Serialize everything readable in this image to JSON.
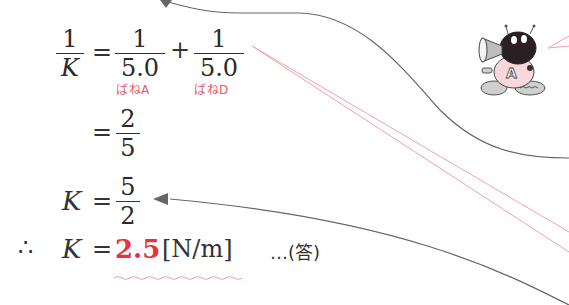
{
  "equation": {
    "line1": {
      "lhs": {
        "numerator": "1",
        "denominator": "K"
      },
      "equals": "=",
      "term1": {
        "numerator": "1",
        "denominator": "5.0",
        "label": "ばねA"
      },
      "plus": "+",
      "term2": {
        "numerator": "1",
        "denominator": "5.0",
        "label": "ばねD"
      }
    },
    "line2": {
      "equals": "=",
      "numerator": "2",
      "denominator": "5"
    },
    "line3": {
      "lhs": "K",
      "equals": "=",
      "numerator": "5",
      "denominator": "2"
    },
    "line4": {
      "therefore": "∴",
      "lhs": "K",
      "equals": "=",
      "value": "2.5",
      "unit": "[N/m]",
      "answer_marker": "…(答)"
    }
  },
  "colors": {
    "text": "#2a2a2a",
    "accent_red": "#e8323c",
    "label_pink": "#e85a6a",
    "arrow_gray": "#666666",
    "pointer_pink": "#f2a0aa"
  },
  "illustration": {
    "name": "robot-mascot",
    "badge_letter": "A"
  }
}
